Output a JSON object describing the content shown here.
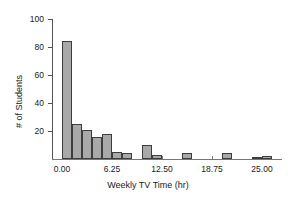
{
  "chart_data": {
    "type": "bar",
    "title": "",
    "subtitle": "",
    "xlabel": "Weekly TV Time (hr)",
    "ylabel": "# of Students",
    "xlim": [
      -1.25,
      27.5
    ],
    "ylim": [
      0,
      105
    ],
    "bin_width": 1.25,
    "grid": false,
    "legend": null,
    "xticks": [
      0.0,
      6.25,
      12.5,
      18.75,
      25.0
    ],
    "xtick_labels": [
      "0.00",
      "6.25",
      "12.50",
      "18.75",
      "25.00"
    ],
    "yticks": [
      20,
      40,
      60,
      80,
      100
    ],
    "ytick_labels": [
      "20",
      "40",
      "60",
      "80",
      "100"
    ],
    "bar_color": "#a9a9a9",
    "bar_edge_color": "#3d3d3d",
    "axis_color": "#555555",
    "bins": [
      {
        "left": 0.0,
        "right": 1.25,
        "count": 84
      },
      {
        "left": 1.25,
        "right": 2.5,
        "count": 25
      },
      {
        "left": 2.5,
        "right": 3.75,
        "count": 21
      },
      {
        "left": 3.75,
        "right": 5.0,
        "count": 16
      },
      {
        "left": 5.0,
        "right": 6.25,
        "count": 18
      },
      {
        "left": 6.25,
        "right": 7.5,
        "count": 5
      },
      {
        "left": 7.5,
        "right": 8.75,
        "count": 4
      },
      {
        "left": 8.75,
        "right": 10.0,
        "count": 0
      },
      {
        "left": 10.0,
        "right": 11.25,
        "count": 10
      },
      {
        "left": 11.25,
        "right": 12.5,
        "count": 3
      },
      {
        "left": 12.5,
        "right": 13.75,
        "count": 0
      },
      {
        "left": 13.75,
        "right": 15.0,
        "count": 0
      },
      {
        "left": 15.0,
        "right": 16.25,
        "count": 4
      },
      {
        "left": 16.25,
        "right": 17.5,
        "count": 0
      },
      {
        "left": 17.5,
        "right": 18.75,
        "count": 0
      },
      {
        "left": 18.75,
        "right": 20.0,
        "count": 0
      },
      {
        "left": 20.0,
        "right": 21.25,
        "count": 4
      },
      {
        "left": 21.25,
        "right": 22.5,
        "count": 0
      },
      {
        "left": 22.5,
        "right": 23.75,
        "count": 0
      },
      {
        "left": 23.75,
        "right": 25.0,
        "count": 1
      },
      {
        "left": 25.0,
        "right": 26.25,
        "count": 2
      }
    ],
    "categories": [
      "0.00-1.25",
      "1.25-2.50",
      "2.50-3.75",
      "3.75-5.00",
      "5.00-6.25",
      "6.25-7.50",
      "7.50-8.75",
      "8.75-10.00",
      "10.00-11.25",
      "11.25-12.50",
      "12.50-13.75",
      "13.75-15.00",
      "15.00-16.25",
      "16.25-17.50",
      "17.50-18.75",
      "18.75-20.00",
      "20.00-21.25",
      "21.25-22.50",
      "22.50-23.75",
      "23.75-25.00",
      "25.00-26.25"
    ],
    "values": [
      84,
      25,
      21,
      16,
      18,
      5,
      4,
      0,
      10,
      3,
      0,
      0,
      4,
      0,
      0,
      0,
      4,
      0,
      0,
      1,
      2
    ]
  }
}
